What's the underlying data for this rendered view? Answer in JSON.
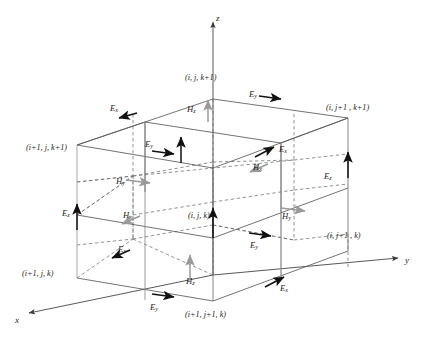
{
  "figure": {
    "colors": {
      "solid_edge": "#5a5a5a",
      "dashed_edge": "#6e6e6e",
      "e_field_arrow": "#111111",
      "h_field_arrow": "#9a9a9a",
      "vertical_edge_light": "#9a9a9a",
      "text": "#1a1a1a",
      "background": "#ffffff"
    },
    "axes": [
      {
        "name": "z-axis",
        "label": "z",
        "direction": "up",
        "x": 216,
        "y": 14
      },
      {
        "name": "y-axis",
        "label": "y",
        "direction": "right",
        "x": 405,
        "y": 256
      },
      {
        "name": "x-axis",
        "label": "x",
        "direction": "down-left",
        "x": 15,
        "y": 316
      }
    ],
    "nodes": [
      {
        "name": "node-i-j-kplus1",
        "label": "(i, j, k+1)",
        "x": 185,
        "y": 74
      },
      {
        "name": "node-i-jplus1-kplus1",
        "label": "(i, j+1 , k+1)",
        "x": 326,
        "y": 104
      },
      {
        "name": "node-iplus1-j-kplus1",
        "label": "(i+1, j, k+1)",
        "x": 26,
        "y": 144
      },
      {
        "name": "node-i-j-k",
        "label": "(i, j, k)",
        "x": 188,
        "y": 212
      },
      {
        "name": "node-i-jplus1-k",
        "label": "(i, j+1 , k)",
        "x": 327,
        "y": 232
      },
      {
        "name": "node-iplus1-j-k",
        "label": "(i+1, j, k)",
        "x": 22,
        "y": 270
      },
      {
        "name": "node-iplus1-jplus1-k",
        "label": "(i+1, j+1, k)",
        "x": 185,
        "y": 311
      }
    ],
    "field_labels": [
      {
        "name": "field-ex-top-left",
        "base": "E",
        "sub": "x",
        "x": 110,
        "y": 104,
        "type": "E"
      },
      {
        "name": "field-ey-top-right",
        "base": "E",
        "sub": "y",
        "x": 249,
        "y": 90,
        "type": "E"
      },
      {
        "name": "field-hz-top",
        "base": "H",
        "sub": "z",
        "x": 187,
        "y": 105,
        "type": "H"
      },
      {
        "name": "field-ey-upper-mid",
        "base": "E",
        "sub": "y",
        "x": 145,
        "y": 140,
        "type": "E"
      },
      {
        "name": "field-ex-upper-right",
        "base": "E",
        "sub": "x",
        "x": 279,
        "y": 145,
        "type": "E"
      },
      {
        "name": "field-hx-upper-right",
        "base": "H",
        "sub": "x",
        "x": 253,
        "y": 163,
        "type": "H"
      },
      {
        "name": "field-ez-right",
        "base": "E",
        "sub": "z",
        "x": 324,
        "y": 172,
        "type": "E"
      },
      {
        "name": "field-hy-left",
        "base": "H",
        "sub": "y",
        "x": 116,
        "y": 177,
        "type": "H"
      },
      {
        "name": "field-ez-left",
        "base": "E",
        "sub": "z",
        "x": 62,
        "y": 209,
        "type": "E"
      },
      {
        "name": "field-hx-left",
        "base": "H",
        "sub": "x",
        "x": 123,
        "y": 211,
        "type": "H"
      },
      {
        "name": "field-hy-right",
        "base": "H",
        "sub": "y",
        "x": 282,
        "y": 212,
        "type": "H"
      },
      {
        "name": "field-ex-lower-left",
        "base": "E",
        "sub": "x",
        "x": 118,
        "y": 245,
        "type": "E"
      },
      {
        "name": "field-ey-lower-right",
        "base": "E",
        "sub": "y",
        "x": 250,
        "y": 241,
        "type": "E"
      },
      {
        "name": "field-hz-bottom",
        "base": "H",
        "sub": "z",
        "x": 186,
        "y": 277,
        "type": "H"
      },
      {
        "name": "field-ex-bottom-right",
        "base": "E",
        "sub": "x",
        "x": 280,
        "y": 284,
        "type": "E"
      },
      {
        "name": "field-ey-bottom",
        "base": "E",
        "sub": "y",
        "x": 150,
        "y": 303,
        "type": "E"
      }
    ]
  }
}
